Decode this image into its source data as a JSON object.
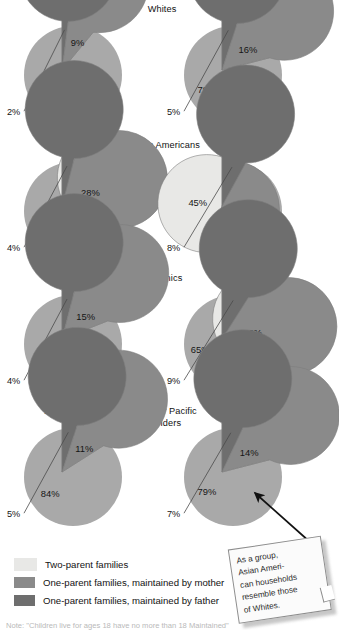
{
  "figure": {
    "title_implied": "Family structure by race and Hispanic origin",
    "colors": {
      "two_parent": "#e8e8e6",
      "mother": "#8a8a8a",
      "father": "#6e6e6e",
      "shadow": "#a9a9a9",
      "outline": "#7d7d7d",
      "text": "#151515"
    }
  },
  "rows": [
    {
      "group": "Whites",
      "group_lines": [
        "Whites"
      ],
      "left": {
        "year": "1970",
        "slices": [
          {
            "label": "89%",
            "value": 89,
            "series": "two_parent",
            "label_pos": "inside"
          },
          {
            "label": "9%",
            "value": 9,
            "series": "mother",
            "label_pos": "inside"
          },
          {
            "label": "2%",
            "value": 2,
            "series": "father",
            "label_pos": "callout"
          }
        ]
      },
      "right": {
        "year": "2000",
        "slices": [
          {
            "label": "79%",
            "value": 79,
            "series": "two_parent",
            "label_pos": "inside"
          },
          {
            "label": "16%",
            "value": 16,
            "series": "mother",
            "label_pos": "inside"
          },
          {
            "label": "5%",
            "value": 5,
            "series": "father",
            "label_pos": "callout"
          }
        ]
      }
    },
    {
      "group": "African Americans",
      "group_lines": [
        "African Americans"
      ],
      "left": {
        "year": "1970",
        "slices": [
          {
            "label": "68%",
            "value": 68,
            "series": "two_parent",
            "label_pos": "inside"
          },
          {
            "label": "28%",
            "value": 28,
            "series": "mother",
            "label_pos": "inside"
          },
          {
            "label": "4%",
            "value": 4,
            "series": "father",
            "label_pos": "callout"
          }
        ]
      },
      "right": {
        "year": "2000",
        "slices": [
          {
            "label": "45%",
            "value": 45,
            "series": "two_parent",
            "label_pos": "inside"
          },
          {
            "label": "47%",
            "value": 47,
            "series": "mother",
            "label_pos": "inside"
          },
          {
            "label": "8%",
            "value": 8,
            "series": "father",
            "label_pos": "callout"
          }
        ]
      }
    },
    {
      "group": "Hispanics",
      "group_lines": [
        "Hispanics"
      ],
      "left": {
        "year": "1970",
        "slices": [
          {
            "label": "81%",
            "value": 81,
            "series": "two_parent",
            "label_pos": "inside"
          },
          {
            "label": "15%",
            "value": 15,
            "series": "mother",
            "label_pos": "inside"
          },
          {
            "label": "4%",
            "value": 4,
            "series": "father",
            "label_pos": "callout"
          }
        ]
      },
      "right": {
        "year": "2000",
        "slices": [
          {
            "label": "65%",
            "value": 65,
            "series": "two_parent",
            "label_pos": "inside"
          },
          {
            "label": "26%",
            "value": 26,
            "series": "mother",
            "label_pos": "inside"
          },
          {
            "label": "9%",
            "value": 9,
            "series": "father",
            "label_pos": "callout"
          }
        ]
      }
    },
    {
      "group": "Asians or Pacific Islanders",
      "group_lines": [
        "Asians or Pacific",
        "Islanders"
      ],
      "left": {
        "year": "1980",
        "slices": [
          {
            "label": "84%",
            "value": 84,
            "series": "two_parent",
            "label_pos": "inside"
          },
          {
            "label": "11%",
            "value": 11,
            "series": "mother",
            "label_pos": "inside"
          },
          {
            "label": "5%",
            "value": 5,
            "series": "father",
            "label_pos": "callout"
          }
        ]
      },
      "right": {
        "year": "2000",
        "slices": [
          {
            "label": "79%",
            "value": 79,
            "series": "two_parent",
            "label_pos": "inside"
          },
          {
            "label": "14%",
            "value": 14,
            "series": "mother",
            "label_pos": "inside"
          },
          {
            "label": "7%",
            "value": 7,
            "series": "father",
            "label_pos": "callout"
          }
        ]
      }
    }
  ],
  "legend": {
    "items": [
      {
        "swatch": "two_parent",
        "label": "Two-parent families"
      },
      {
        "swatch": "mother",
        "label": "One-parent families, maintained by mother"
      },
      {
        "swatch": "father",
        "label": "One-parent families, maintained by father"
      }
    ]
  },
  "note": {
    "text": "As a group, Asian Ameri-can households resemble those of Whites.",
    "lines": [
      "As a group,",
      "Asian Ameri-",
      "can households",
      "resemble those",
      "of Whites."
    ],
    "points_to": "asians-2000-pie"
  },
  "source_note": {
    "text_partial": "Note: \"Children live for ages 18 have no more than 18 Maintained\""
  },
  "chart_data": {
    "type": "pie",
    "series_names": [
      "Two-parent families",
      "One-parent families, maintained by mother",
      "One-parent families, maintained by father"
    ],
    "legend_position": "bottom-left",
    "units": "percent",
    "pies": [
      {
        "group": "Whites",
        "year": "1970",
        "values": [
          89,
          9,
          2
        ],
        "labels": [
          "89%",
          "9%",
          "2%"
        ]
      },
      {
        "group": "Whites",
        "year": "2000",
        "values": [
          79,
          16,
          5
        ],
        "labels": [
          "79%",
          "16%",
          "5%"
        ]
      },
      {
        "group": "African Americans",
        "year": "1970",
        "values": [
          68,
          28,
          4
        ],
        "labels": [
          "68%",
          "28%",
          "4%"
        ]
      },
      {
        "group": "African Americans",
        "year": "2000",
        "values": [
          45,
          47,
          8
        ],
        "labels": [
          "45%",
          "47%",
          "8%"
        ]
      },
      {
        "group": "Hispanics",
        "year": "1970",
        "values": [
          81,
          15,
          4
        ],
        "labels": [
          "81%",
          "15%",
          "4%"
        ]
      },
      {
        "group": "Hispanics",
        "year": "2000",
        "values": [
          65,
          26,
          9
        ],
        "labels": [
          "65%",
          "26%",
          "9%"
        ]
      },
      {
        "group": "Asians or Pacific Islanders",
        "year": "1980",
        "values": [
          84,
          11,
          5
        ],
        "labels": [
          "84%",
          "11%",
          "5%"
        ]
      },
      {
        "group": "Asians or Pacific Islanders",
        "year": "2000",
        "values": [
          79,
          14,
          7
        ],
        "labels": [
          "79%",
          "14%",
          "7%"
        ]
      }
    ],
    "annotations": [
      {
        "text": "As a group, Asian American households resemble those of Whites.",
        "target": "Asians or Pacific Islanders 2000"
      }
    ]
  }
}
